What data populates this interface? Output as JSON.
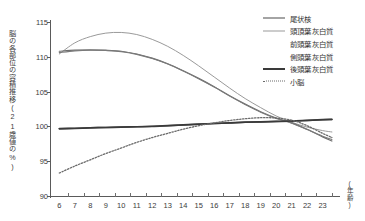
{
  "chart_data": {
    "type": "line",
    "title": "",
    "xlabel": "(年齢)",
    "ylabel": "脳の各部位の容積推移(21歳値の%)",
    "xlim": [
      5.4,
      23.8
    ],
    "ylim": [
      90,
      115
    ],
    "yticks": [
      90,
      95,
      100,
      105,
      110,
      115
    ],
    "xticks": [
      6,
      7,
      8,
      9,
      10,
      11,
      12,
      13,
      14,
      15,
      16,
      17,
      18,
      19,
      20,
      21,
      22,
      23
    ],
    "grid": false,
    "legend_position": "top-right",
    "x": [
      6,
      7,
      8,
      9,
      10,
      11,
      12,
      13,
      14,
      15,
      16,
      17,
      18,
      19,
      20,
      21,
      22,
      23,
      23.6
    ],
    "series": [
      {
        "name": "尾状核",
        "style": "solid-dark",
        "color": "#4a4a4a",
        "values": [
          99.7,
          99.75,
          99.8,
          99.85,
          99.9,
          99.95,
          100.0,
          100.1,
          100.2,
          100.3,
          100.4,
          100.5,
          100.6,
          100.65,
          100.7,
          100.75,
          100.85,
          100.95,
          101.0
        ]
      },
      {
        "name": "頭頂葉灰白質",
        "style": "solid-light",
        "color": "#9a9a9a",
        "values": [
          110.4,
          112.0,
          112.9,
          113.4,
          113.5,
          113.2,
          112.5,
          111.5,
          110.2,
          108.7,
          107.1,
          105.5,
          104.0,
          102.7,
          101.5,
          100.6,
          99.9,
          99.4,
          99.2
        ]
      },
      {
        "name": "前頭葉灰白質",
        "style": "solid-mid",
        "color": "#6d6d6d",
        "values": [
          110.8,
          110.95,
          111.0,
          110.95,
          110.8,
          110.4,
          109.8,
          109.0,
          108.0,
          106.9,
          105.7,
          104.4,
          103.2,
          102.1,
          101.2,
          100.5,
          99.6,
          98.5,
          97.9
        ]
      },
      {
        "name": "側頭葉灰白質",
        "style": "solid-mid2",
        "color": "#7a7a7a",
        "values": [
          110.6,
          110.85,
          110.95,
          110.9,
          110.75,
          110.35,
          109.75,
          108.95,
          107.95,
          106.85,
          105.65,
          104.35,
          103.15,
          102.05,
          101.15,
          100.45,
          99.55,
          98.6,
          98.1
        ]
      },
      {
        "name": "後頭葉灰白質",
        "style": "solid-bold",
        "color": "#3a3a3a",
        "values": [
          99.65,
          99.7,
          99.78,
          99.84,
          99.9,
          99.95,
          100.02,
          100.12,
          100.22,
          100.32,
          100.42,
          100.52,
          100.6,
          100.66,
          100.72,
          100.78,
          100.88,
          100.98,
          101.02
        ]
      },
      {
        "name": "小脳",
        "style": "dotted",
        "color": "#6a6a6a",
        "values": [
          93.3,
          94.3,
          95.2,
          96.1,
          96.9,
          97.7,
          98.4,
          99.0,
          99.6,
          100.1,
          100.5,
          100.85,
          101.1,
          101.25,
          101.2,
          100.9,
          100.1,
          99.0,
          98.4
        ]
      }
    ]
  },
  "axis": {
    "y_ticks": [
      "90",
      "95",
      "100",
      "105",
      "110",
      "115"
    ],
    "x_ticks": [
      "6",
      "7",
      "8",
      "9",
      "10",
      "11",
      "12",
      "13",
      "14",
      "15",
      "16",
      "17",
      "18",
      "19",
      "20",
      "21",
      "22",
      "23"
    ],
    "y_title": "脳の各部位の容積推移(21歳値の%)",
    "x_title": "(年齢)"
  },
  "legend": {
    "items": [
      {
        "label": "尾状核"
      },
      {
        "label": "頭頂葉灰白質"
      },
      {
        "label": "前頭葉灰白質"
      },
      {
        "label": "側頭葉灰白質"
      },
      {
        "label": "後頭葉灰白質"
      },
      {
        "label": "小脳"
      }
    ]
  }
}
